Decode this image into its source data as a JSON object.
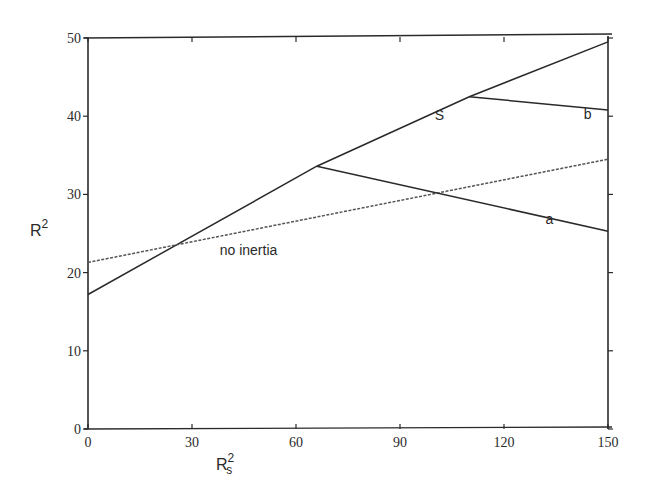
{
  "chart_data": {
    "type": "line",
    "title": "",
    "xlabel": "R_s^2",
    "ylabel": "R^2",
    "xlabel_parts": {
      "base": "R",
      "sub": "s",
      "sup": "2"
    },
    "ylabel_parts": {
      "base": "R",
      "sup": "2"
    },
    "xlim": [
      0,
      150
    ],
    "ylim": [
      0,
      50
    ],
    "xticks": [
      0,
      30,
      60,
      90,
      120,
      150
    ],
    "yticks": [
      0,
      10,
      20,
      30,
      40,
      50
    ],
    "xtick_labels": [
      "0",
      "30",
      "60",
      "90",
      "120",
      "150"
    ],
    "ytick_labels": [
      "0",
      "10",
      "20",
      "30",
      "40",
      "50"
    ],
    "grid": false,
    "legend": null,
    "series": [
      {
        "name": "S",
        "style": "solid",
        "x": [
          0,
          66,
          110,
          150
        ],
        "y": [
          17.2,
          33.6,
          42.5,
          49.5
        ],
        "label_pos": [
          100,
          39.5
        ]
      },
      {
        "name": "no inertia",
        "style": "dashed",
        "x": [
          0,
          150
        ],
        "y": [
          21.3,
          34.5
        ],
        "label_pos": [
          38,
          22.2
        ]
      },
      {
        "name": "a",
        "style": "solid",
        "x": [
          66,
          150
        ],
        "y": [
          33.6,
          25.3
        ],
        "label_pos": [
          132,
          26.2
        ]
      },
      {
        "name": "b",
        "style": "solid",
        "x": [
          110,
          150
        ],
        "y": [
          42.5,
          40.8
        ],
        "label_pos": [
          143,
          39.6
        ]
      }
    ]
  },
  "labels": {
    "curve_S": "S",
    "curve_no_inertia": "no inertia",
    "curve_a": "a",
    "curve_b": "b",
    "y_base": "R",
    "y_sup": "2",
    "x_base": "R",
    "x_sub": "s",
    "x_sup": "2"
  },
  "colors": {
    "line": "#2a2a2a",
    "dashed": "#555555",
    "background": "#ffffff"
  }
}
